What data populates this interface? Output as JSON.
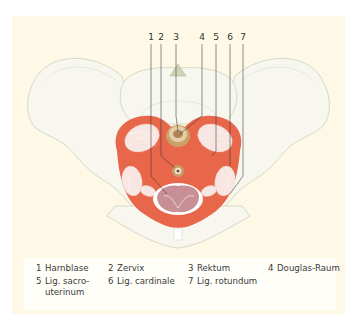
{
  "figure": {
    "type": "anatomical-illustration",
    "colors": {
      "panel_background": "#fdf9e6",
      "legend_background": "#fffef8",
      "bone": "#f6f6ee",
      "bone_outline": "#d9dccb",
      "ligament_red": "#e8664a",
      "ligament_fiber": "#f7e3e0",
      "cervix_tan": "#c9a26a",
      "bladder_inner": "#c78d93",
      "leader_line": "#333333",
      "text": "#3a3a3a"
    },
    "callouts": [
      {
        "num": "1",
        "x": 139
      },
      {
        "num": "2",
        "x": 149
      },
      {
        "num": "3",
        "x": 164
      },
      {
        "num": "4",
        "x": 190
      },
      {
        "num": "5",
        "x": 204
      },
      {
        "num": "6",
        "x": 218
      },
      {
        "num": "7",
        "x": 231
      }
    ]
  },
  "legend": {
    "items": [
      {
        "num": "1",
        "label": "Harnblase"
      },
      {
        "num": "2",
        "label": "Zervix"
      },
      {
        "num": "3",
        "label": "Rektum"
      },
      {
        "num": "4",
        "label": "Douglas-Raum"
      },
      {
        "num": "5",
        "label": "Lig. sacro-",
        "label_line2": "uterinum"
      },
      {
        "num": "6",
        "label": "Lig. cardinale"
      },
      {
        "num": "7",
        "label": "Lig. rotundum"
      }
    ]
  }
}
